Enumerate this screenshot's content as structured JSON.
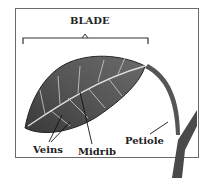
{
  "diagram": {
    "title": "BLADE",
    "labels": {
      "veins": "Veins",
      "midrib": "Midrib",
      "petiole": "Petiole"
    }
  }
}
